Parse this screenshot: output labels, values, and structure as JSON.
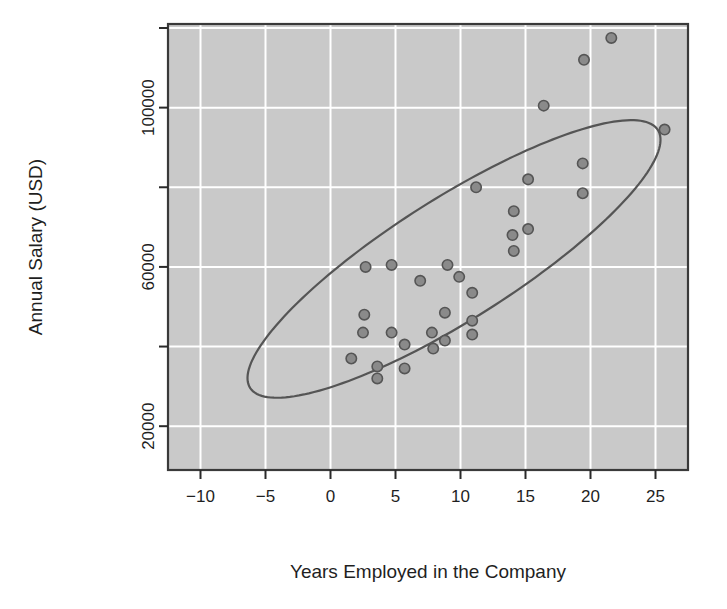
{
  "chart_data": {
    "type": "scatter",
    "title": "",
    "xlabel": "Years Employed in the Company",
    "ylabel": "Annual Salary (USD)",
    "xlim": [
      -12.5,
      27.5
    ],
    "ylim": [
      9000,
      121000
    ],
    "xticks": [
      -10,
      -5,
      0,
      5,
      10,
      15,
      20,
      25
    ],
    "xtick_labels": [
      "-10",
      "-5",
      "0",
      "5",
      "10",
      "15",
      "20",
      "25"
    ],
    "yticks": [
      20000,
      40000,
      60000,
      80000,
      100000,
      120000
    ],
    "ytick_labels": [
      "20000",
      "",
      "60000",
      "",
      "100000",
      ""
    ],
    "ytick_labels_shown": [
      "20000",
      "60000",
      "100000"
    ],
    "grid": true,
    "grid_color": "#ffffff",
    "panel_background": "#c9c9c9",
    "point_color": "#8a8a8a",
    "point_edge_color": "#555555",
    "ellipse_color": "#555555",
    "legend": null,
    "annotations": [
      {
        "kind": "ellipse",
        "label": "confidence-ellipse",
        "center_x": 9.5,
        "center_y": 62000,
        "semi_major": 19.5,
        "semi_minor": 5.2,
        "rotation_deg": -37
      }
    ],
    "points": [
      {
        "x": 21.6,
        "y": 117500
      },
      {
        "x": 19.5,
        "y": 112000
      },
      {
        "x": 16.4,
        "y": 100500
      },
      {
        "x": 25.7,
        "y": 94500
      },
      {
        "x": 19.4,
        "y": 86000
      },
      {
        "x": 15.2,
        "y": 82000
      },
      {
        "x": 19.4,
        "y": 78500
      },
      {
        "x": 11.2,
        "y": 80000
      },
      {
        "x": 14.1,
        "y": 74000
      },
      {
        "x": 14.0,
        "y": 68000
      },
      {
        "x": 15.2,
        "y": 69500
      },
      {
        "x": 14.1,
        "y": 64000
      },
      {
        "x": 2.7,
        "y": 60000
      },
      {
        "x": 4.7,
        "y": 60500
      },
      {
        "x": 6.9,
        "y": 56500
      },
      {
        "x": 9.0,
        "y": 60500
      },
      {
        "x": 9.9,
        "y": 57500
      },
      {
        "x": 10.9,
        "y": 53500
      },
      {
        "x": 2.6,
        "y": 48000
      },
      {
        "x": 8.8,
        "y": 48500
      },
      {
        "x": 10.9,
        "y": 46500
      },
      {
        "x": 2.5,
        "y": 43500
      },
      {
        "x": 4.7,
        "y": 43500
      },
      {
        "x": 7.8,
        "y": 43500
      },
      {
        "x": 10.9,
        "y": 43000
      },
      {
        "x": 5.7,
        "y": 40500
      },
      {
        "x": 8.8,
        "y": 41500
      },
      {
        "x": 7.9,
        "y": 39500
      },
      {
        "x": 1.6,
        "y": 37000
      },
      {
        "x": 3.6,
        "y": 35000
      },
      {
        "x": 5.7,
        "y": 34500
      },
      {
        "x": 3.6,
        "y": 32000
      }
    ]
  },
  "axes": {
    "x_axis_label": "Years Employed in the Company",
    "y_axis_label": "Annual Salary (USD)",
    "x_tick_texts": [
      "-10",
      "-5",
      "0",
      "5",
      "10",
      "15",
      "20",
      "25"
    ],
    "y_tick_texts": [
      "20000",
      "60000",
      "100000"
    ]
  }
}
